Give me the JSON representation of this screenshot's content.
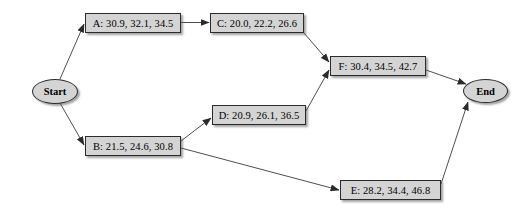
{
  "diagram": {
    "background_color": "#ffffff",
    "node_fill_color": "#d4d4d4",
    "node_border_color": "#2b2b2b",
    "edge_color": "#3a3a3a",
    "nodes": [
      {
        "id": "start",
        "label": "Start",
        "shape": "ellipse"
      },
      {
        "id": "A",
        "label": "A: 30.9, 32.1, 34.5",
        "shape": "box"
      },
      {
        "id": "B",
        "label": "B: 21.5, 24.6, 30.8",
        "shape": "box"
      },
      {
        "id": "C",
        "label": "C: 20.0, 22.2, 26.6",
        "shape": "box"
      },
      {
        "id": "D",
        "label": "D: 20.9, 26.1, 36.5",
        "shape": "box"
      },
      {
        "id": "E",
        "label": "E: 28.2, 34.4, 46.8",
        "shape": "box"
      },
      {
        "id": "F",
        "label": "F: 30.4, 34.5, 42.7",
        "shape": "box"
      },
      {
        "id": "end",
        "label": "End",
        "shape": "ellipse"
      }
    ],
    "edges": [
      {
        "from": "start",
        "to": "A"
      },
      {
        "from": "start",
        "to": "B"
      },
      {
        "from": "A",
        "to": "C"
      },
      {
        "from": "C",
        "to": "F"
      },
      {
        "from": "B",
        "to": "D"
      },
      {
        "from": "B",
        "to": "E"
      },
      {
        "from": "D",
        "to": "F"
      },
      {
        "from": "F",
        "to": "end"
      },
      {
        "from": "E",
        "to": "end"
      }
    ]
  }
}
